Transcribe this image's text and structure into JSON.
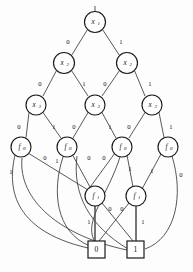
{
  "figure": {
    "kind": "binary-decision-diagram",
    "background_color": "#fdfdfd",
    "stroke_color": "#1a1a1a",
    "edge_color": "#3a3a3a",
    "width": 193,
    "height": 272
  },
  "nodes": [
    {
      "id": "x1",
      "label": "x",
      "sub": "1",
      "cx": 95,
      "cy": 22,
      "r": 10.5
    },
    {
      "id": "x2a",
      "label": "x",
      "sub": "2",
      "cx": 64,
      "cy": 63,
      "r": 10.5
    },
    {
      "id": "x2b",
      "label": "x",
      "sub": "2",
      "cx": 127,
      "cy": 63,
      "r": 10.5
    },
    {
      "id": "x3a",
      "label": "x",
      "sub": "3",
      "cx": 36,
      "cy": 105,
      "r": 10.0
    },
    {
      "id": "x3b",
      "label": "x",
      "sub": "3",
      "cx": 95,
      "cy": 105,
      "r": 10.0
    },
    {
      "id": "x3c",
      "label": "x",
      "sub": "3",
      "cx": 152,
      "cy": 105,
      "r": 10.0
    },
    {
      "id": "f0a",
      "label": "f",
      "sub": "0",
      "cx": 21,
      "cy": 147,
      "r": 10.0
    },
    {
      "id": "f0b",
      "label": "f",
      "sub": "0",
      "cx": 67,
      "cy": 147,
      "r": 10.0
    },
    {
      "id": "f0c",
      "label": "f",
      "sub": "0",
      "cx": 122,
      "cy": 147,
      "r": 10.0
    },
    {
      "id": "f0d",
      "label": "f",
      "sub": "0",
      "cx": 168,
      "cy": 147,
      "r": 10.0
    },
    {
      "id": "f1a",
      "label": "f",
      "sub": "1",
      "cx": 95,
      "cy": 196,
      "r": 10.0
    },
    {
      "id": "f1b",
      "label": "f",
      "sub": "1",
      "cx": 136,
      "cy": 196,
      "r": 10.0
    }
  ],
  "terminals": [
    {
      "id": "t0",
      "label": "0",
      "x": 88,
      "y": 241,
      "w": 17,
      "h": 17
    },
    {
      "id": "t1",
      "label": "1",
      "x": 127,
      "y": 241,
      "w": 17,
      "h": 17
    }
  ],
  "root_stub": {
    "x": 95,
    "y_top": 6,
    "y_bottom": 11
  },
  "edges": [
    {
      "id": "e-x1-x2a",
      "from": "x1",
      "to": "x2a",
      "label": "0",
      "lx": 68,
      "ly": 42
    },
    {
      "id": "e-x1-x2b",
      "from": "x1",
      "to": "x2b",
      "label": "1",
      "lx": 120,
      "ly": 42
    },
    {
      "id": "e-x2a-x3a",
      "from": "x2a",
      "to": "x3a",
      "label": "0",
      "lx": 38,
      "ly": 84
    },
    {
      "id": "e-x2a-x3b",
      "from": "x2a",
      "to": "x3b",
      "label": "1",
      "lx": 84,
      "ly": 84
    },
    {
      "id": "e-x2b-x3b",
      "from": "x2b",
      "to": "x3b",
      "label": "0",
      "lx": 105,
      "ly": 84
    },
    {
      "id": "e-x2b-x3c",
      "from": "x2b",
      "to": "x3c",
      "label": "1",
      "lx": 150,
      "ly": 84
    },
    {
      "id": "e-x3a-f0a",
      "from": "x3a",
      "to": "f0a",
      "label": "0",
      "lx": 19,
      "ly": 126
    },
    {
      "id": "e-x3a-f0b",
      "from": "x3a",
      "to": "f0b",
      "label": "1",
      "lx": 53,
      "ly": 126
    },
    {
      "id": "e-x3b-f0b",
      "from": "x3b",
      "to": "f0b",
      "label": "0",
      "lx": 73,
      "ly": 126
    },
    {
      "id": "e-x3b-f0c",
      "from": "x3b",
      "to": "f0c",
      "label": "1",
      "lx": 110,
      "ly": 126
    },
    {
      "id": "e-x3c-f0c",
      "from": "x3c",
      "to": "f0c",
      "label": "0",
      "lx": 128,
      "ly": 126
    },
    {
      "id": "e-x3c-f0d",
      "from": "x3c",
      "to": "f0d",
      "label": "1",
      "lx": 170,
      "ly": 126
    },
    {
      "id": "e-f0a-0",
      "from": "f0a",
      "to": "t0",
      "label": "1",
      "lx": 11,
      "ly": 172
    },
    {
      "id": "e-f0a-f1a",
      "from": "f0a",
      "to": "f1a",
      "label": "0",
      "lx": 45,
      "ly": 158
    },
    {
      "id": "e-f0b-f1a",
      "from": "f0b",
      "to": "f1a",
      "label": "1",
      "lx": 57,
      "ly": 160
    },
    {
      "id": "e-f0b-0",
      "from": "f0b",
      "to": "t0",
      "label": "0",
      "lx": 89,
      "ly": 158
    },
    {
      "id": "e-f0c-f1b",
      "from": "f0c",
      "to": "f1b",
      "label": "0",
      "lx": 103,
      "ly": 158
    },
    {
      "id": "e-f0c-0",
      "from": "f0c",
      "to": "t0",
      "label": "1",
      "lx": 129,
      "ly": 168
    },
    {
      "id": "e-f0d-f1b",
      "from": "f0d",
      "to": "f1b",
      "label": "1",
      "lx": 152,
      "ly": 170
    },
    {
      "id": "e-f0d-1",
      "from": "f0d",
      "to": "t1",
      "label": "0",
      "lx": 180,
      "ly": 174
    },
    {
      "id": "e-f1a-0",
      "from": "f1a",
      "to": "t0",
      "label": "1",
      "lx": 89,
      "ly": 221
    },
    {
      "id": "e-f1a-1",
      "from": "f1a",
      "to": "t1",
      "label": "0",
      "lx": 110,
      "ly": 208
    },
    {
      "id": "e-f1b-0",
      "from": "f1b",
      "to": "t0",
      "label": "0",
      "lx": 122,
      "ly": 208
    },
    {
      "id": "e-f1b-1",
      "from": "f1b",
      "to": "t1",
      "label": "1",
      "lx": 142,
      "ly": 221
    }
  ]
}
